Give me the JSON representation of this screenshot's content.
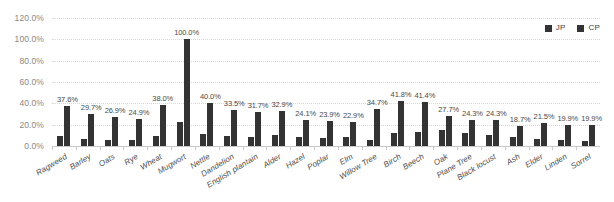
{
  "chart_data": {
    "type": "bar",
    "title": "",
    "subtitle": "",
    "xlabel": "",
    "ylabel": "",
    "ylim": [
      0,
      120
    ],
    "grid": true,
    "legend_position": "top-right",
    "ytick_labels": [
      "120.0%",
      "100.0%",
      "80.0%",
      "60.0%",
      "40.0%",
      "20.0%",
      "0.0%"
    ],
    "ytick_values": [
      120,
      100,
      80,
      60,
      40,
      20,
      0
    ],
    "categories": [
      "Ragweed",
      "Barley",
      "Oats",
      "Rye",
      "Wheat",
      "Mugwort",
      "Nettle",
      "Dandelion",
      "English plantain",
      "Alder",
      "Hazel",
      "Poplar",
      "Elm",
      "Willow Tree",
      "Birch",
      "Beech",
      "Oak",
      "Plane Tree",
      "Black locust",
      "Ash",
      "Elder",
      "Linden",
      "Sorrel"
    ],
    "series": [
      {
        "name": "JP",
        "color": "#333333",
        "values": [
          9.0,
          6.5,
          5.5,
          6.0,
          9.0,
          22.5,
          11.0,
          9.0,
          8.0,
          10.0,
          8.5,
          7.5,
          8.0,
          5.5,
          12.5,
          13.5,
          15.0,
          12.5,
          10.0,
          8.0,
          6.5,
          6.0,
          5.0
        ]
      },
      {
        "name": "CP",
        "color": "#333333",
        "values": [
          37.6,
          29.7,
          26.9,
          24.9,
          38.0,
          100.0,
          40.0,
          33.5,
          31.7,
          32.9,
          24.1,
          23.9,
          22.9,
          34.7,
          41.8,
          41.4,
          27.7,
          24.3,
          24.3,
          18.7,
          21.5,
          19.9,
          19.9
        ]
      }
    ],
    "data_labels": [
      "37.6%",
      "29.7%",
      "26.9%",
      "24.9%",
      "38.0%",
      "100.0%",
      "40.0%",
      "33.5%",
      "31.7%",
      "32.9%",
      "24.1%",
      "23.9%",
      "22.9%",
      "34.7%",
      "41.8%",
      "41.4%",
      "27.7%",
      "24.3%",
      "24.3%",
      "18.7%",
      "21.5%",
      "19.9%",
      "19.9%"
    ]
  },
  "legend": {
    "entries": [
      {
        "label": "JP",
        "color": "#333333"
      },
      {
        "label": "CP",
        "color": "#333333"
      }
    ]
  }
}
